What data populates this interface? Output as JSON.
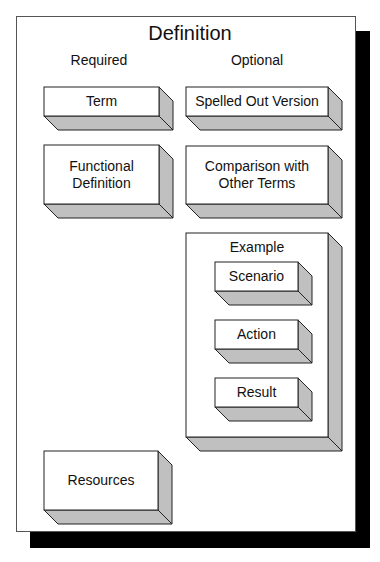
{
  "diagram": {
    "title": "Definition",
    "columns": {
      "required": "Required",
      "optional": "Optional"
    },
    "required_items": [
      {
        "label": "Term"
      },
      {
        "label": "Functional Definition"
      },
      {
        "label": "Resources"
      }
    ],
    "optional_items": [
      {
        "label": "Spelled Out Version"
      },
      {
        "label": "Comparison with Other Terms"
      }
    ],
    "example": {
      "label": "Example",
      "children": [
        {
          "label": "Scenario"
        },
        {
          "label": "Action"
        },
        {
          "label": "Result"
        }
      ]
    }
  },
  "colors": {
    "face": "#ffffff",
    "depth": "#c0c0c0",
    "outline": "#222222",
    "shadow": "#000000"
  }
}
